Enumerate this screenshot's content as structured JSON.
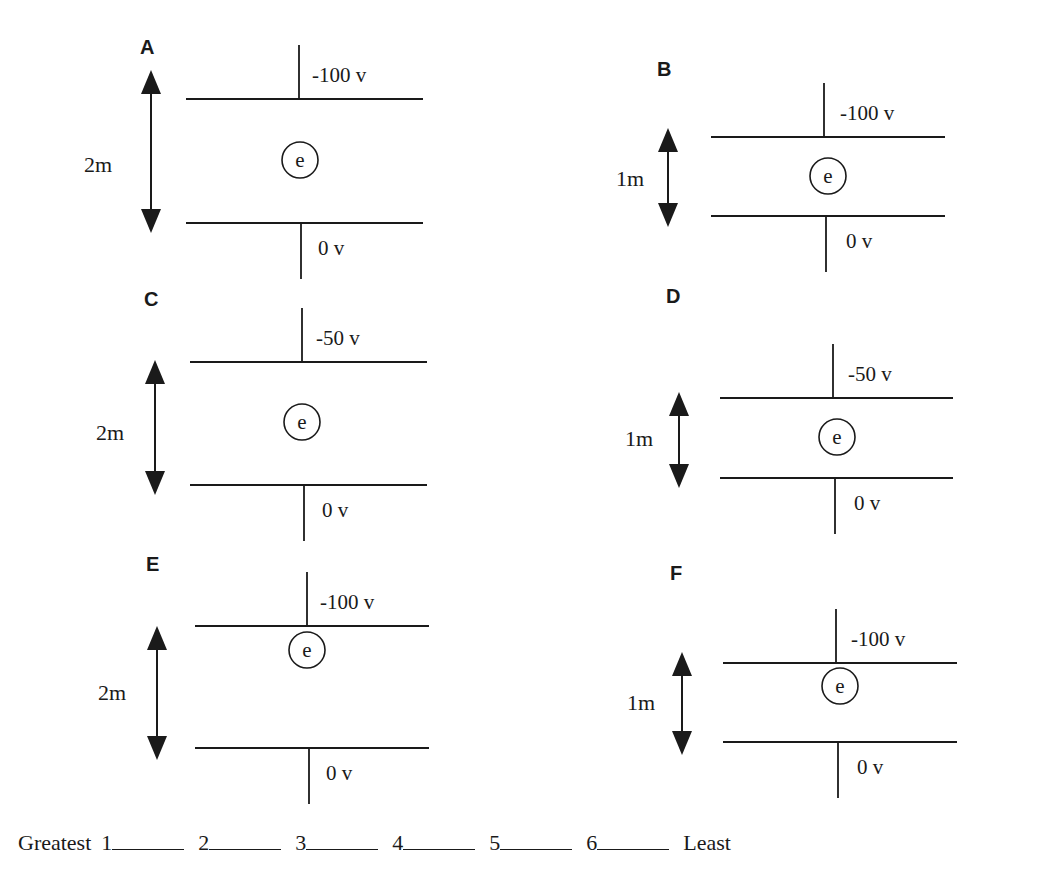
{
  "panels": [
    {
      "id": "A",
      "label": "A",
      "top_voltage": "-100 v",
      "bottom_voltage": "0 v",
      "separation": "2m",
      "electron": "e",
      "geom": {
        "labelX": 140,
        "labelY": 54,
        "plateX1": 186,
        "plateX2": 423,
        "topY": 99,
        "botY": 223,
        "leadX": 299,
        "arrowX": 151,
        "arrowTop": 70,
        "arrowBot": 233,
        "sepX": 84,
        "sepY": 172,
        "eX": 300,
        "eY": 160,
        "vX": 312
      }
    },
    {
      "id": "B",
      "label": "B",
      "top_voltage": "-100 v",
      "bottom_voltage": "0 v",
      "separation": "1m",
      "electron": "e",
      "geom": {
        "labelX": 657,
        "labelY": 76,
        "plateX1": 711,
        "plateX2": 945,
        "topY": 137,
        "botY": 216,
        "leadX": 824,
        "arrowX": 668,
        "arrowTop": 128,
        "arrowBot": 227,
        "sepX": 616,
        "sepY": 186,
        "eX": 828,
        "eY": 176,
        "vX": 840
      }
    },
    {
      "id": "C",
      "label": "C",
      "top_voltage": "-50 v",
      "bottom_voltage": "0 v",
      "separation": "2m",
      "electron": "e",
      "geom": {
        "labelX": 144,
        "labelY": 306,
        "plateX1": 190,
        "plateX2": 427,
        "topY": 362,
        "botY": 485,
        "leadX": 302,
        "arrowX": 155,
        "arrowTop": 360,
        "arrowBot": 495,
        "sepX": 96,
        "sepY": 440,
        "eX": 302,
        "eY": 422,
        "vX": 316
      }
    },
    {
      "id": "D",
      "label": "D",
      "top_voltage": "-50 v",
      "bottom_voltage": "0 v",
      "separation": "1m",
      "electron": "e",
      "geom": {
        "labelX": 666,
        "labelY": 303,
        "plateX1": 720,
        "plateX2": 953,
        "topY": 398,
        "botY": 478,
        "leadX": 833,
        "arrowX": 679,
        "arrowTop": 392,
        "arrowBot": 488,
        "sepX": 625,
        "sepY": 446,
        "eX": 837,
        "eY": 437,
        "vX": 848
      }
    },
    {
      "id": "E",
      "label": "E",
      "top_voltage": "-100 v",
      "bottom_voltage": "0 v",
      "separation": "2m",
      "electron": "e",
      "geom": {
        "labelX": 146,
        "labelY": 571,
        "plateX1": 195,
        "plateX2": 429,
        "topY": 626,
        "botY": 748,
        "leadX": 307,
        "arrowX": 157,
        "arrowTop": 626,
        "arrowBot": 760,
        "sepX": 98,
        "sepY": 700,
        "eX": 307,
        "eY": 650,
        "vX": 320
      }
    },
    {
      "id": "F",
      "label": "F",
      "top_voltage": "-100 v",
      "bottom_voltage": "0 v",
      "separation": "1m",
      "electron": "e",
      "geom": {
        "labelX": 670,
        "labelY": 580,
        "plateX1": 723,
        "plateX2": 957,
        "topY": 663,
        "botY": 742,
        "leadX": 836,
        "arrowX": 682,
        "arrowTop": 652,
        "arrowBot": 755,
        "sepX": 627,
        "sepY": 710,
        "eX": 840,
        "eY": 686,
        "vX": 851
      }
    }
  ],
  "ranking": {
    "left_label": "Greatest",
    "right_label": "Least",
    "slots": [
      {
        "number": "1",
        "answer": ""
      },
      {
        "number": "2",
        "answer": ""
      },
      {
        "number": "3",
        "answer": ""
      },
      {
        "number": "4",
        "answer": ""
      },
      {
        "number": "5",
        "answer": ""
      },
      {
        "number": "6",
        "answer": ""
      }
    ]
  }
}
